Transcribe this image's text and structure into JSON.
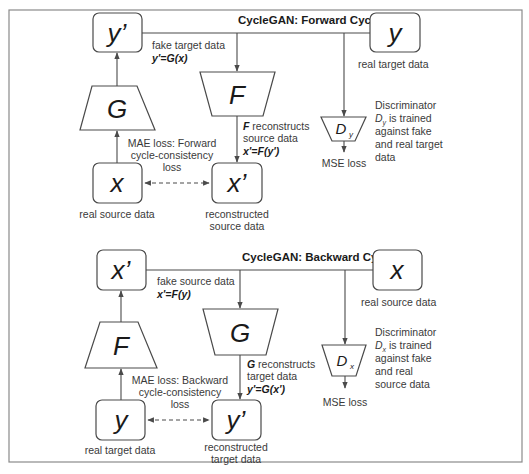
{
  "forward": {
    "title": "CycleGAN: Forward Cycle",
    "nodes": {
      "fake_target": {
        "symbol": "y’",
        "caption_line1": "fake target data",
        "equation": "y'=G(x)"
      },
      "real_target": {
        "symbol": "y",
        "caption": "real target data"
      },
      "real_source": {
        "symbol": "x",
        "caption": "real source data"
      },
      "reconstructed_source": {
        "symbol": "x’",
        "caption_line1": "reconstructed",
        "caption_line2": "source data"
      }
    },
    "generators": {
      "G": {
        "symbol": "G"
      },
      "F": {
        "symbol": "F",
        "caption_bold": "F",
        "caption_line1": " reconstructs",
        "caption_line2": "source data",
        "equation": "x'=F(y')"
      }
    },
    "discriminator": {
      "symbol": "D",
      "subscript": "y",
      "desc_line1": "Discriminator",
      "desc_line2_sym": "D",
      "desc_line2_sub": "y",
      "desc_line2": " is trained",
      "desc_line3": "against fake",
      "desc_line4": "and real target",
      "desc_line5": "data",
      "loss": "MSE loss"
    },
    "cycle_loss": {
      "line1": "MAE loss: Forward",
      "line2": "cycle-consistency",
      "line3": "loss"
    }
  },
  "backward": {
    "title": "CycleGAN: Backward Cycle",
    "nodes": {
      "fake_source": {
        "symbol": "x’",
        "caption_line1": "fake source data",
        "equation": "x'=F(y)"
      },
      "real_source": {
        "symbol": "x",
        "caption": "real source data"
      },
      "real_target": {
        "symbol": "y",
        "caption": "real target data"
      },
      "reconstructed_target": {
        "symbol": "y’",
        "caption_line1": "reconstructed",
        "caption_line2": "target data"
      }
    },
    "generators": {
      "F": {
        "symbol": "F"
      },
      "G": {
        "symbol": "G",
        "caption_bold": "G",
        "caption_line1": " reconstructs",
        "caption_line2": "target data",
        "equation": "y'=G(x')"
      }
    },
    "discriminator": {
      "symbol": "D",
      "subscript": "x",
      "desc_line1": "Discriminator",
      "desc_line2_sym": "D",
      "desc_line2_sub": "x",
      "desc_line2": " is trained",
      "desc_line3": "against fake",
      "desc_line4": "and real",
      "desc_line5": "source data",
      "loss": "MSE loss"
    },
    "cycle_loss": {
      "line1": "MAE loss: Backward",
      "line2": "cycle-consistency",
      "line3": "loss"
    }
  }
}
